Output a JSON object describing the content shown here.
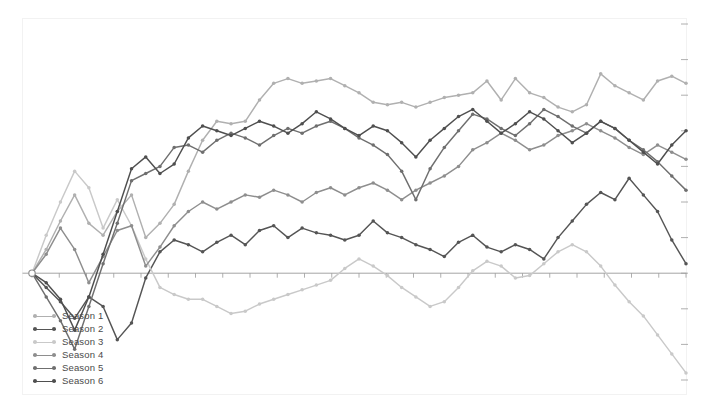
{
  "chart_data": {
    "type": "line",
    "title": "",
    "subtitle": "",
    "xlabel": "",
    "ylabel": "",
    "grid": false,
    "legend_position": "bottom-left",
    "xlim": [
      0,
      46
    ],
    "ylim": [
      -4.5,
      10.5
    ],
    "zero_line": true,
    "markers": true,
    "x": [
      0,
      1,
      2,
      3,
      4,
      5,
      6,
      7,
      8,
      9,
      10,
      11,
      12,
      13,
      14,
      15,
      16,
      17,
      18,
      19,
      20,
      21,
      22,
      23,
      24,
      25,
      26,
      27,
      28,
      29,
      30,
      31,
      32,
      33,
      34,
      35,
      36,
      37,
      38,
      39,
      40,
      41,
      42,
      43,
      44,
      45,
      46
    ],
    "series": [
      {
        "name": "Season 1",
        "color": "#b0b0b0",
        "values": [
          0,
          1.0,
          2.2,
          3.3,
          2.1,
          1.6,
          2.6,
          3.3,
          1.5,
          2.1,
          2.9,
          4.3,
          5.6,
          6.4,
          6.3,
          6.4,
          7.3,
          8.0,
          8.2,
          8.0,
          8.1,
          8.2,
          7.9,
          7.6,
          7.2,
          7.1,
          7.2,
          7.0,
          7.2,
          7.4,
          7.5,
          7.6,
          8.1,
          7.3,
          8.2,
          7.6,
          7.4,
          7.0,
          6.8,
          7.1,
          8.4,
          7.9,
          7.6,
          7.3,
          8.1,
          8.3,
          8.0
        ]
      },
      {
        "name": "Season 2",
        "color": "#555555",
        "values": [
          0,
          -0.6,
          -1.2,
          -1.9,
          -1.0,
          -1.4,
          -2.8,
          -2.1,
          -0.2,
          0.9,
          1.4,
          1.2,
          0.9,
          1.3,
          1.6,
          1.2,
          1.8,
          2.0,
          1.5,
          1.9,
          1.7,
          1.6,
          1.4,
          1.6,
          2.2,
          1.7,
          1.5,
          1.2,
          1.0,
          0.7,
          1.3,
          1.6,
          1.1,
          0.9,
          1.2,
          1.0,
          0.6,
          1.5,
          2.2,
          2.9,
          3.4,
          3.1,
          4.0,
          3.3,
          2.6,
          1.4,
          0.4
        ]
      },
      {
        "name": "Season 3",
        "color": "#c9c9c9",
        "values": [
          0,
          1.6,
          3.0,
          4.3,
          3.6,
          1.9,
          3.1,
          2.0,
          0.6,
          -0.6,
          -0.9,
          -1.1,
          -1.1,
          -1.4,
          -1.7,
          -1.6,
          -1.3,
          -1.1,
          -0.9,
          -0.7,
          -0.5,
          -0.3,
          0.2,
          0.6,
          0.3,
          -0.1,
          -0.6,
          -1.0,
          -1.4,
          -1.2,
          -0.6,
          0.1,
          0.5,
          0.3,
          -0.2,
          -0.1,
          0.4,
          0.9,
          1.2,
          0.9,
          0.3,
          -0.5,
          -1.2,
          -1.8,
          -2.6,
          -3.4,
          -4.2
        ]
      },
      {
        "name": "Season 4",
        "color": "#8e8e8e",
        "values": [
          0,
          0.8,
          1.9,
          1.0,
          -0.4,
          0.7,
          1.8,
          2.0,
          0.3,
          1.1,
          2.0,
          2.6,
          3.0,
          2.7,
          3.0,
          3.3,
          3.2,
          3.5,
          3.3,
          3.0,
          3.4,
          3.6,
          3.3,
          3.6,
          3.8,
          3.5,
          3.1,
          3.5,
          3.8,
          4.1,
          4.5,
          5.2,
          5.5,
          5.9,
          5.6,
          5.2,
          5.4,
          5.8,
          6.0,
          6.3,
          6.0,
          5.7,
          5.3,
          5.0,
          5.4,
          5.1,
          4.8
        ]
      },
      {
        "name": "Season 5",
        "color": "#6f6f6f",
        "values": [
          0,
          -1.0,
          -2.0,
          -3.2,
          -1.4,
          0.4,
          2.1,
          3.9,
          4.2,
          4.5,
          5.3,
          5.4,
          5.1,
          5.6,
          5.9,
          5.7,
          5.4,
          5.8,
          6.1,
          5.9,
          6.2,
          6.4,
          6.1,
          5.7,
          5.4,
          5.0,
          4.3,
          3.1,
          4.4,
          5.3,
          6.0,
          6.7,
          6.5,
          6.1,
          5.8,
          6.3,
          6.9,
          6.6,
          6.2,
          5.9,
          6.4,
          6.1,
          5.6,
          5.2,
          4.7,
          4.1,
          3.5
        ]
      },
      {
        "name": "Season 6",
        "color": "#4f4f4f",
        "values": [
          0,
          -0.4,
          -1.1,
          -2.4,
          -1.0,
          0.8,
          2.6,
          4.4,
          4.9,
          4.2,
          4.6,
          5.7,
          6.2,
          6.0,
          5.8,
          6.1,
          6.4,
          6.2,
          5.9,
          6.3,
          6.8,
          6.5,
          6.1,
          5.8,
          6.2,
          6.0,
          5.5,
          4.9,
          5.6,
          6.1,
          6.6,
          6.9,
          6.4,
          5.9,
          6.3,
          6.8,
          6.5,
          6.0,
          5.5,
          5.9,
          6.4,
          6.1,
          5.6,
          5.1,
          4.6,
          5.4,
          6.0
        ]
      }
    ]
  },
  "legend": {
    "items": [
      {
        "label": "Season 1"
      },
      {
        "label": "Season 2"
      },
      {
        "label": "Season 3"
      },
      {
        "label": "Season 4"
      },
      {
        "label": "Season 5"
      },
      {
        "label": "Season 6"
      }
    ]
  },
  "axes": {
    "frame_color": "#f2f2f2",
    "zero_line_color": "#9a9a9a",
    "tick_color": "#9a9a9a",
    "x_tick_count": 24,
    "y_tick_count": 10
  }
}
